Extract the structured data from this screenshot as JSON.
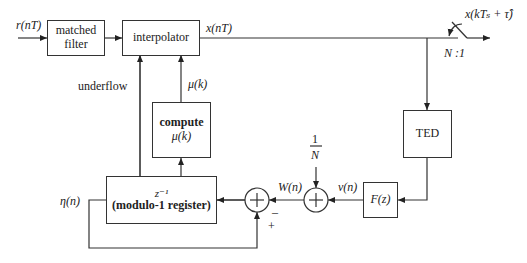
{
  "diagram": {
    "type": "timing-recovery-block-diagram",
    "blocks": {
      "matched_filter": {
        "line1": "matched",
        "line2": "filter"
      },
      "interpolator": {
        "label": "interpolator"
      },
      "ted": {
        "label": "TED"
      },
      "compute": {
        "line1": "compute",
        "line2": "μ(k)"
      },
      "register": {
        "line1": "z⁻¹",
        "line2": "(modulo-1 register)"
      },
      "loop_filter": {
        "label": "F(z)"
      }
    },
    "signals": {
      "input": "r(nT)",
      "interp_out": "x(nT)",
      "output": "x(kTₛ + τ̂)",
      "decimation": "N :1",
      "underflow": "underflow",
      "mu": "μ(k)",
      "eta": "η(n)",
      "W": "W(n)",
      "v": "v(n)",
      "one_over_N_num": "1",
      "one_over_N_den": "N",
      "minus": "–",
      "plus": "+"
    },
    "colors": {
      "line": "#333333",
      "background": "#ffffff"
    }
  }
}
